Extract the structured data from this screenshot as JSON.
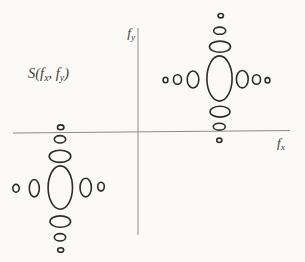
{
  "canvas": {
    "width": 305,
    "height": 262,
    "background": "#fbfaf7",
    "ellipse_color": "#2e2b28",
    "ellipse_stroke_width": 1.6,
    "axis_color": "#8b8b88",
    "axis_stroke_width": 1,
    "label_color": "#3f3d3a"
  },
  "labels": {
    "spectrum": {
      "prefix": "S(",
      "f1": "f",
      "sub1": "x",
      "sep": ", ",
      "f2": "f",
      "sub2": "y",
      "suffix": ")"
    },
    "x_axis": {
      "letter": "f",
      "sub": "x"
    },
    "y_axis": {
      "letter": "f",
      "sub": "y"
    }
  },
  "axes": {
    "vertical": {
      "x": 138,
      "y1": 28,
      "y2": 235
    },
    "horizontal": {
      "x1": 13,
      "y1": 133,
      "x2": 290,
      "y2": 130.5
    }
  },
  "clusters": [
    {
      "name": "upper-right-cluster",
      "cx": 219.5,
      "cy": 78.5,
      "ellipses": [
        {
          "name": "center-lobe",
          "dx": 0,
          "dy": 0,
          "rx": 12.6,
          "ry": 22.6
        },
        {
          "name": "left-lobe-1",
          "dx": -26.5,
          "dy": 1,
          "rx": 5.8,
          "ry": 8.5
        },
        {
          "name": "left-lobe-2",
          "dx": -42,
          "dy": 1,
          "rx": 4,
          "ry": 4.8
        },
        {
          "name": "left-lobe-3",
          "dx": -54,
          "dy": 1.5,
          "rx": 2.4,
          "ry": 2.7
        },
        {
          "name": "right-lobe-1",
          "dx": 22.8,
          "dy": 0.7,
          "rx": 5.9,
          "ry": 8.7
        },
        {
          "name": "right-lobe-2",
          "dx": 37,
          "dy": 1,
          "rx": 4,
          "ry": 4.8
        },
        {
          "name": "right-lobe-3",
          "dx": 48,
          "dy": 1.8,
          "rx": 2.4,
          "ry": 2.7
        },
        {
          "name": "top-lobe-1",
          "dx": 0.5,
          "dy": -31.8,
          "rx": 10.5,
          "ry": 5.6
        },
        {
          "name": "top-lobe-2",
          "dx": 0.2,
          "dy": -47.8,
          "rx": 6,
          "ry": 3.6
        },
        {
          "name": "top-lobe-3",
          "dx": 1.2,
          "dy": -62.8,
          "rx": 2.7,
          "ry": 2.2
        },
        {
          "name": "bottom-lobe-1",
          "dx": 0.5,
          "dy": 33.2,
          "rx": 10,
          "ry": 5.4
        },
        {
          "name": "bottom-lobe-2",
          "dx": -0.2,
          "dy": 48.2,
          "rx": 6,
          "ry": 3.4
        },
        {
          "name": "bottom-lobe-3",
          "dx": -0.2,
          "dy": 61.8,
          "rx": 2.6,
          "ry": 2.2
        }
      ]
    },
    {
      "name": "lower-left-cluster",
      "cx": 60.3,
      "cy": 187.6,
      "ellipses": [
        {
          "name": "center-lobe",
          "dx": 0,
          "dy": 0,
          "rx": 12.2,
          "ry": 21.7
        },
        {
          "name": "top-lobe-1",
          "dx": -0.3,
          "dy": -31.3,
          "rx": 10.8,
          "ry": 6.1
        },
        {
          "name": "top-lobe-2",
          "dx": -0.3,
          "dy": -48.3,
          "rx": 5.7,
          "ry": 3.7
        },
        {
          "name": "top-lobe-3",
          "dx": 0.4,
          "dy": -60.3,
          "rx": 3.2,
          "ry": 2.4
        },
        {
          "name": "bottom-lobe-1",
          "dx": 0,
          "dy": 34,
          "rx": 10.3,
          "ry": 5.7
        },
        {
          "name": "bottom-lobe-2",
          "dx": -0.3,
          "dy": 49.7,
          "rx": 5.7,
          "ry": 3.7
        },
        {
          "name": "bottom-lobe-3",
          "dx": 0.4,
          "dy": 62.4,
          "rx": 3,
          "ry": 2.3
        },
        {
          "name": "left-lobe-1",
          "dx": -26,
          "dy": 0.6,
          "rx": 5,
          "ry": 8.7
        },
        {
          "name": "left-lobe-2",
          "dx": -44.3,
          "dy": 0.7,
          "rx": 3.2,
          "ry": 3.9
        },
        {
          "name": "right-lobe-1",
          "dx": 25.4,
          "dy": 0,
          "rx": 5.7,
          "ry": 9.3
        },
        {
          "name": "right-lobe-2",
          "dx": 40.7,
          "dy": -1,
          "rx": 3.3,
          "ry": 4.3
        }
      ]
    }
  ]
}
